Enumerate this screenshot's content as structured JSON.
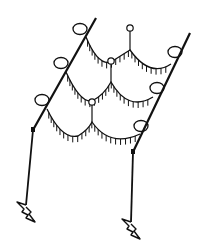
{
  "diagram": {
    "stroke_color": "#111111",
    "background": "#ffffff",
    "poles": [
      {
        "name": "left-pole",
        "top": [
          96,
          18
        ],
        "joint": [
          33,
          130
        ],
        "foot": [
          26,
          205
        ]
      },
      {
        "name": "right-pole",
        "top": [
          190,
          33
        ],
        "joint": [
          133,
          152
        ],
        "foot": [
          131,
          222
        ]
      }
    ],
    "large_rings": [
      {
        "name": "left-ring-1",
        "cx": 80,
        "cy": 29
      },
      {
        "name": "left-ring-2",
        "cx": 61,
        "cy": 63
      },
      {
        "name": "left-ring-3",
        "cx": 42,
        "cy": 100
      },
      {
        "name": "right-ring-1",
        "cx": 175,
        "cy": 52
      },
      {
        "name": "right-ring-2",
        "cx": 157,
        "cy": 88
      },
      {
        "name": "right-ring-3",
        "cx": 141,
        "cy": 126
      }
    ],
    "small_rings": [
      {
        "name": "top-hanger-ring",
        "cx": 130,
        "cy": 28,
        "stem_to": [
          130,
          50
        ]
      },
      {
        "name": "middle-hanger-ring",
        "cx": 111,
        "cy": 61,
        "stem_to": [
          111,
          82
        ]
      },
      {
        "name": "lower-hanger-ring",
        "cx": 92,
        "cy": 102,
        "stem_to": [
          92,
          122
        ]
      }
    ],
    "garlands": [
      {
        "name": "top-garland",
        "path": "M86 37 Q98 66 111 62 Q122 55 130 50 Q150 78 171 64"
      },
      {
        "name": "middle-garland",
        "path": "M66 72 Q80 103 92 101 Q104 95 111 82 Q128 112 153 97"
      },
      {
        "name": "bottom-garland",
        "path": "M47 109 Q62 140 78 136 Q88 130 92 122 Q110 148 140 134"
      }
    ]
  }
}
